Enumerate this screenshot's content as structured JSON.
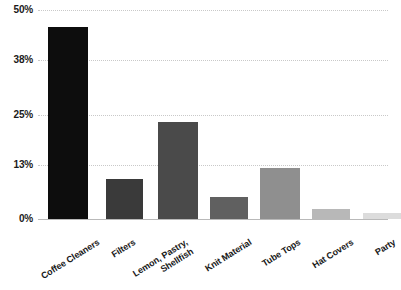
{
  "chart_data": {
    "type": "bar",
    "title": "",
    "subtitle": "",
    "xlabel": "",
    "ylabel": "",
    "categories": [
      "Coffee Cleaners",
      "Filters",
      "Lemon, Pastry,\nShellfish",
      "Knit Material",
      "Tube Tops",
      "Hat Covers",
      "Party"
    ],
    "values": [
      46.0,
      9.6,
      23.2,
      5.3,
      12.3,
      2.4,
      1.4
    ],
    "bar_colors": [
      "#0d0d0d",
      "#3a3a3a",
      "#4a4a4a",
      "#606060",
      "#8f8f8f",
      "#b8b8b8",
      "#dcdcdc"
    ],
    "ylim": [
      0,
      50
    ],
    "ytick_values": [
      0,
      13,
      25,
      38,
      50
    ],
    "ytick_labels": [
      "0%",
      "13%",
      "25%",
      "38%",
      "50%"
    ],
    "grid": true,
    "grid_axis": "y",
    "grid_style": "dotted",
    "grid_color": "#c9c9c9",
    "axis_color": "#b9b9b9",
    "legend": false,
    "legend_position": "none",
    "background_color": "#ffffff",
    "text_color": "#1a1a1a",
    "xtick_label_rotation": -32
  }
}
